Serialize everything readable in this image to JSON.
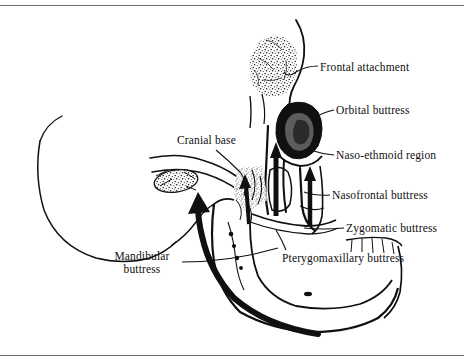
{
  "figure": {
    "medium": "lateral skull line drawing with stipple shading",
    "ink_color": "#101010",
    "background_color": "#ffffff",
    "rule_color": "#6d6d6d"
  },
  "labels": {
    "frontal_attachment": "Frontal attachment",
    "orbital_buttress": "Orbital buttress",
    "naso_ethmoid_region": "Naso-ethmoid region",
    "nasofrontal_buttress": "Nasofrontal buttress",
    "zygomatic_buttress": "Zygomatic buttress",
    "pterygomaxillary_buttress": "Pterygomaxillary buttress",
    "cranial_base": "Cranial base",
    "mandibular_buttress_line1": "Mandibular",
    "mandibular_buttress_line2": "buttress"
  }
}
